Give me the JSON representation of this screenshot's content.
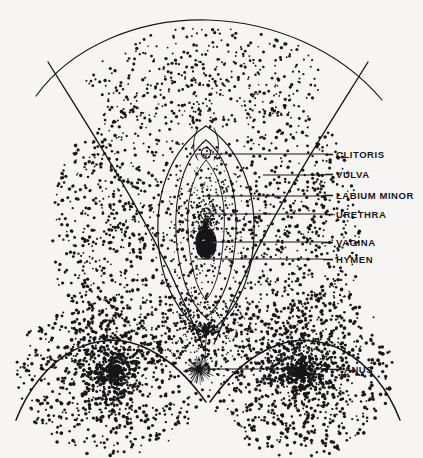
{
  "figure": {
    "background_color": "#f6f5f3",
    "ink_color": "#16161a",
    "style": "stipple engraving",
    "width": 423,
    "height": 458
  },
  "labels": [
    {
      "id": "clitoris",
      "text": "CLITORIS",
      "text_x": 336,
      "text_y": 158,
      "dash_x1": 325,
      "dash_x2": 333,
      "leader_x1": 196,
      "leader_y": 154,
      "leader_x2": 325
    },
    {
      "id": "vulva",
      "text": "VULVA",
      "text_x": 336,
      "text_y": 178,
      "dash_x1": 325,
      "dash_x2": 333,
      "leader_x1": 263,
      "leader_y": 175,
      "leader_x2": 325
    },
    {
      "id": "labium-minor",
      "text": "LABIUM MINOR",
      "text_x": 336,
      "text_y": 199,
      "dash_x1": 325,
      "dash_x2": 333,
      "leader_x1": 205,
      "leader_y": 196,
      "leader_x2": 325
    },
    {
      "id": "urethra",
      "text": "URETHRA",
      "text_x": 336,
      "text_y": 218,
      "dash_x1": 325,
      "dash_x2": 333,
      "leader_x1": 203,
      "leader_y": 214,
      "leader_x2": 325
    },
    {
      "id": "vagina",
      "text": "VAGINA",
      "text_x": 336,
      "text_y": 246,
      "dash_x1": 323,
      "dash_x2": 333,
      "leader_x1": 200,
      "leader_y": 242,
      "leader_x2": 323
    },
    {
      "id": "hymen",
      "text": "HYMEN",
      "text_x": 336,
      "text_y": 263,
      "dash_x1": 323,
      "dash_x2": 333,
      "leader_x1": 197,
      "leader_y": 259,
      "leader_x2": 323
    },
    {
      "id": "anus",
      "text": "ANUS",
      "text_x": 344,
      "text_y": 373,
      "dash_x1": 330,
      "dash_x2": 341,
      "leader_x1": 197,
      "leader_y": 369,
      "leader_x2": 330
    }
  ],
  "stipple": {
    "seed": 20240517,
    "dot_color": "#171718",
    "regions": [
      {
        "name": "mons-pubis",
        "count": 900,
        "cx": 205,
        "cy": 78,
        "rx": 120,
        "ry": 52,
        "min_r": 0.8,
        "max_r": 1.7,
        "density_bias": "bottom"
      },
      {
        "name": "left-labium-majus",
        "count": 1500,
        "cx": 130,
        "cy": 235,
        "rx": 78,
        "ry": 130,
        "min_r": 0.8,
        "max_r": 1.8,
        "density_bias": "left"
      },
      {
        "name": "right-labium-majus",
        "count": 1500,
        "cx": 283,
        "cy": 235,
        "rx": 78,
        "ry": 130,
        "min_r": 0.8,
        "max_r": 1.8,
        "density_bias": "right"
      },
      {
        "name": "left-buttock",
        "count": 1700,
        "cx": 112,
        "cy": 372,
        "rx": 96,
        "ry": 86,
        "min_r": 0.9,
        "max_r": 1.9,
        "density_bias": "center"
      },
      {
        "name": "right-buttock",
        "count": 1700,
        "cx": 300,
        "cy": 372,
        "rx": 96,
        "ry": 86,
        "min_r": 0.9,
        "max_r": 1.9,
        "density_bias": "center"
      },
      {
        "name": "perineum",
        "count": 520,
        "cx": 205,
        "cy": 330,
        "rx": 46,
        "ry": 44,
        "min_r": 0.7,
        "max_r": 1.5,
        "density_bias": "center"
      },
      {
        "name": "labia-inner-shade",
        "count": 620,
        "cx": 205,
        "cy": 225,
        "rx": 40,
        "ry": 85,
        "min_r": 0.6,
        "max_r": 1.3,
        "density_bias": "center"
      }
    ]
  },
  "contours": {
    "mons_arc": "M 36,96 C 72,46 140,18 208,20 C 274,22 340,50 382,100",
    "left_thigh": "M 48,62 C 84,120 130,190 168,268 C 186,306 196,330 202,344",
    "right_thigh": "M 368,62 C 332,120 286,190 248,268 C 230,306 220,330 214,344",
    "left_buttock": "M 16,420 C 40,358 96,322 150,350 C 178,364 196,388 206,402",
    "right_buttock": "M 400,420 C 376,358 320,322 266,350 C 238,364 220,388 210,402",
    "outer_labia_left": "M 206,126 C 172,148 156,190 158,236 C 160,284 180,318 206,334",
    "outer_labia_right": "M 206,126 C 240,148 256,190 254,236 C 252,284 232,318 206,334",
    "inner_labia_left": "M 206,140 C 184,158 174,194 176,234 C 178,274 190,304 206,318",
    "inner_labia_right": "M 206,140 C 228,158 238,194 236,234 C 234,274 222,304 206,318",
    "vestibule_left": "M 206,160 C 192,176 186,202 188,232 C 190,266 196,288 206,300",
    "vestibule_right": "M 206,160 C 220,176 226,202 224,232 C 222,266 216,288 206,300",
    "clitoral_hood_left": "M 198,128 C 192,140 192,152 198,160",
    "clitoral_hood_right": "M 214,128 C 220,140 220,152 214,160",
    "perineal_raphe": "M 206,336 C 206,346 205,354 205,362",
    "fourchette": "M 190,326 C 198,334 214,334 222,326"
  },
  "features": {
    "clitoris": {
      "cx": 206,
      "cy": 153,
      "rx": 4.6,
      "ry": 5.4
    },
    "urethra": {
      "cx": 206,
      "cy": 214,
      "rx": 5.2,
      "ry": 6.0
    },
    "vaginal_opening": {
      "cx": 206,
      "cy": 243,
      "rx": 10,
      "ry": 16
    },
    "anus": {
      "cx": 199,
      "cy": 369,
      "r_inner": 3.2,
      "r_outer": 16,
      "rays": 34
    }
  }
}
